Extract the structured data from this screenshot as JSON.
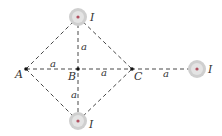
{
  "diagram": {
    "points": {
      "A": {
        "label": "A",
        "x": 26,
        "y": 69
      },
      "B": {
        "label": "B",
        "x": 78,
        "y": 69
      },
      "C": {
        "label": "C",
        "x": 132,
        "y": 69
      }
    },
    "wires": [
      {
        "id": "top",
        "label": "I",
        "x": 78,
        "y": 17
      },
      {
        "id": "bottom",
        "label": "I",
        "x": 78,
        "y": 121
      },
      {
        "id": "right",
        "label": "I",
        "x": 196,
        "y": 69
      }
    ],
    "distance_labels": [
      "a",
      "a",
      "a",
      "a",
      "a"
    ],
    "colors": {
      "line": "#333333",
      "wire_outer": "#cfcfcf",
      "wire_inner": "#e4e4e4",
      "wire_dot": "#b05060"
    }
  }
}
